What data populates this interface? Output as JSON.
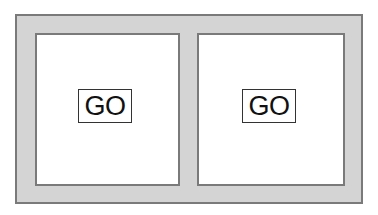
{
  "panels": [
    {
      "id": "left",
      "button_label": "GO"
    },
    {
      "id": "right",
      "button_label": "GO"
    }
  ],
  "colors": {
    "frame_fill": "#d4d4d4",
    "frame_border": "#7a7a7a",
    "panel_fill": "#ffffff",
    "button_border": "#333333",
    "text": "#111111"
  }
}
